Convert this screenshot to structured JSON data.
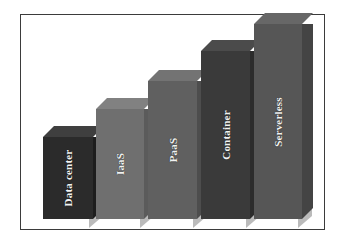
{
  "figure": {
    "background_color": "#ffffff",
    "frame_color": "#3b3b3b",
    "label_color": "#f2f2f2"
  },
  "chart_data": {
    "type": "bar",
    "title": "",
    "subtitle": "",
    "xlabel": "",
    "ylabel": "",
    "grid": false,
    "legend": false,
    "orientation": "vertical",
    "style": "3d-prism",
    "axis_visible": false,
    "tick_labels": [],
    "ylim": [
      0,
      5
    ],
    "categories": [
      "Data center",
      "IaaS",
      "PaaS",
      "Container",
      "Serverless"
    ],
    "values": [
      1,
      2,
      3,
      4,
      5
    ],
    "value_unit": "relative abstraction level",
    "annotations": [],
    "series": [
      {
        "name": "Abstraction level",
        "values": [
          1,
          2,
          3,
          4,
          5
        ]
      }
    ],
    "bars": [
      {
        "label": "Data center",
        "value": 1,
        "front_color": "#2b2b2b",
        "top_color": "#3f3f3f",
        "side_color": "#1d1d1d",
        "left": 22,
        "width": 50,
        "height": 82
      },
      {
        "label": "IaaS",
        "value": 2,
        "front_color": "#6f6f6f",
        "top_color": "#818181",
        "side_color": "#5b5b5b",
        "left": 75,
        "width": 48,
        "height": 110
      },
      {
        "label": "PaaS",
        "value": 3,
        "front_color": "#606060",
        "top_color": "#737373",
        "side_color": "#4d4d4d",
        "left": 127,
        "width": 49,
        "height": 138
      },
      {
        "label": "Container",
        "value": 4,
        "front_color": "#3a3a3a",
        "top_color": "#4b4b4b",
        "side_color": "#2c2c2c",
        "left": 180,
        "width": 49,
        "height": 168
      },
      {
        "label": "Serverless",
        "value": 5,
        "front_color": "#565656",
        "top_color": "#676767",
        "side_color": "#444444",
        "left": 233,
        "width": 48,
        "height": 195
      }
    ]
  }
}
